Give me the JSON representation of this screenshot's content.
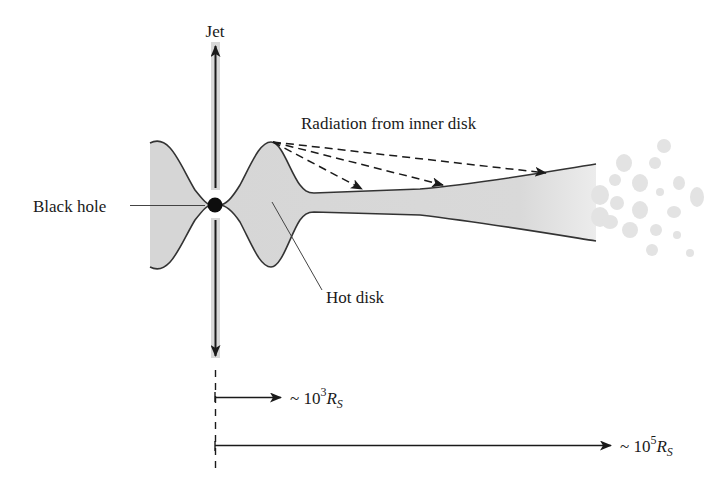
{
  "labels": {
    "jet": "Jet",
    "radiation": "Radiation from inner disk",
    "black_hole": "Black hole",
    "hot_disk": "Hot disk"
  },
  "scales": [
    {
      "prefix": "~ 10",
      "exponent": "3",
      "symbol": "R",
      "subscript": "S"
    },
    {
      "prefix": "~ 10",
      "exponent": "5",
      "symbol": "R",
      "subscript": "S"
    }
  ],
  "colors": {
    "disk_fill": "#d6d6d6",
    "outline": "#333333",
    "jet_band": "#d8d8d8",
    "black_hole": "#0d0d0d",
    "blob": "#e3e3e3"
  }
}
